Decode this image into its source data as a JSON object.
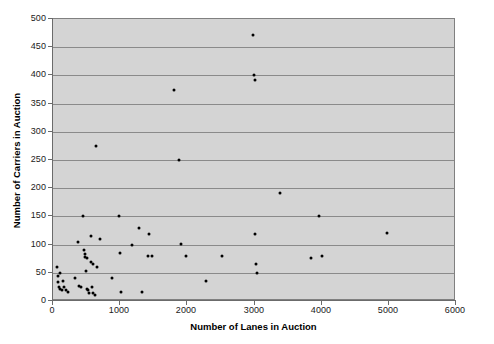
{
  "chart_data": {
    "type": "scatter",
    "title": "",
    "xlabel": "Number of Lanes in Auction",
    "ylabel": "Number of Carriers in Auction",
    "xlim": [
      0,
      6000
    ],
    "ylim": [
      0,
      500
    ],
    "xticks": [
      0,
      1000,
      2000,
      3000,
      4000,
      5000,
      6000
    ],
    "yticks": [
      0,
      50,
      100,
      150,
      200,
      250,
      300,
      350,
      400,
      450,
      500
    ],
    "xtick_labels": [
      "0",
      "1000",
      "2000",
      "3000",
      "4000",
      "5000",
      "6000"
    ],
    "ytick_labels": [
      "0",
      "50",
      "100",
      "150",
      "200",
      "250",
      "300",
      "350",
      "400",
      "450",
      "500"
    ],
    "grid": "horizontal",
    "plot_background": "#d4d4d4",
    "marker_color": "#000000",
    "gridline_color": "#8a8a8a",
    "legend": null,
    "points": [
      [
        60,
        60
      ],
      [
        70,
        45
      ],
      [
        80,
        33
      ],
      [
        90,
        25
      ],
      [
        100,
        50
      ],
      [
        110,
        21
      ],
      [
        130,
        20
      ],
      [
        150,
        36
      ],
      [
        170,
        24
      ],
      [
        190,
        20
      ],
      [
        230,
        16
      ],
      [
        330,
        41
      ],
      [
        370,
        105
      ],
      [
        390,
        27
      ],
      [
        410,
        24
      ],
      [
        450,
        150
      ],
      [
        460,
        91
      ],
      [
        470,
        84
      ],
      [
        480,
        78
      ],
      [
        490,
        53
      ],
      [
        500,
        22
      ],
      [
        510,
        76
      ],
      [
        520,
        19
      ],
      [
        530,
        14
      ],
      [
        560,
        115
      ],
      [
        570,
        70
      ],
      [
        580,
        24
      ],
      [
        590,
        15
      ],
      [
        600,
        65
      ],
      [
        620,
        10
      ],
      [
        650,
        60
      ],
      [
        700,
        110
      ],
      [
        880,
        40
      ],
      [
        980,
        150
      ],
      [
        1000,
        85
      ],
      [
        1010,
        16
      ],
      [
        1180,
        100
      ],
      [
        1280,
        130
      ],
      [
        1330,
        16
      ],
      [
        1420,
        80
      ],
      [
        1430,
        119
      ],
      [
        1480,
        80
      ],
      [
        1880,
        250
      ],
      [
        1900,
        101
      ],
      [
        1980,
        80
      ],
      [
        2280,
        36
      ],
      [
        2520,
        80
      ],
      [
        2980,
        472
      ],
      [
        2990,
        400
      ],
      [
        3000,
        392
      ],
      [
        3010,
        118
      ],
      [
        3020,
        65
      ],
      [
        3030,
        50
      ],
      [
        3380,
        192
      ],
      [
        3840,
        77
      ],
      [
        3960,
        151
      ],
      [
        4000,
        80
      ],
      [
        4980,
        120
      ],
      [
        1800,
        375
      ],
      [
        640,
        275
      ]
    ]
  }
}
